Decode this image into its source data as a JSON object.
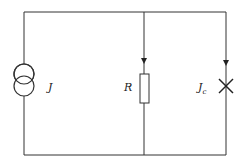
{
  "diagram": {
    "type": "circuit",
    "components": [
      {
        "id": "source",
        "symbol": "current-source",
        "label": "J"
      },
      {
        "id": "resistor",
        "symbol": "resistor",
        "label": "R"
      },
      {
        "id": "junction",
        "symbol": "josephson-junction",
        "label": "J",
        "label_sub": "c"
      }
    ],
    "colors": {
      "wire": "#333333",
      "background": "#ffffff"
    }
  }
}
